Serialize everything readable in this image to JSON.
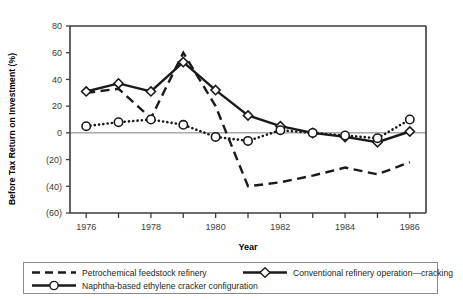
{
  "chart_data": {
    "type": "line",
    "title": "",
    "xlabel": "Year",
    "ylabel": "Before Tax Return on Investment (%)",
    "x": [
      1976,
      1977,
      1978,
      1979,
      1980,
      1981,
      1982,
      1983,
      1984,
      1985,
      1986
    ],
    "xtick_labels": [
      "1976",
      "1978",
      "1980",
      "1982",
      "1984",
      "1986"
    ],
    "xtick_values": [
      1976,
      1978,
      1980,
      1982,
      1984,
      1986
    ],
    "xlim": [
      1975.5,
      1986.5
    ],
    "ylim": [
      -60,
      80
    ],
    "ytick_labels": [
      "80",
      "60",
      "40",
      "20",
      "0",
      "(20)",
      "(40)",
      "(60)"
    ],
    "ytick_values": [
      80,
      60,
      40,
      20,
      0,
      -20,
      -40,
      -60
    ],
    "grid": false,
    "zero_line": true,
    "legend_position": "bottom",
    "series": [
      {
        "name": "Petrochemical feedstock refinery",
        "style": "dashed",
        "marker": "none",
        "color": "#1a1a1a",
        "values": [
          30,
          33,
          11,
          60,
          20,
          -40,
          -37,
          -32,
          -26,
          -31,
          -22
        ]
      },
      {
        "name": "Conventional refinery operation—cracking",
        "style": "solid",
        "marker": "diamond",
        "color": "#1a1a1a",
        "values": [
          31,
          37,
          31,
          53,
          32,
          13,
          5,
          0,
          -3,
          -7,
          1
        ]
      },
      {
        "name": "Naphtha-based ethylene cracker configuration",
        "style": "dotted",
        "marker": "circle",
        "color": "#1a1a1a",
        "values": [
          5,
          8,
          10,
          6,
          -3,
          -6,
          2,
          0,
          -2,
          -4,
          10
        ]
      }
    ]
  },
  "legend": {
    "entries": [
      {
        "label": "Petrochemical feedstock refinery"
      },
      {
        "label": "Conventional refinery operation—cracking"
      },
      {
        "label": "Naphtha-based ethylene cracker configuration"
      }
    ]
  }
}
